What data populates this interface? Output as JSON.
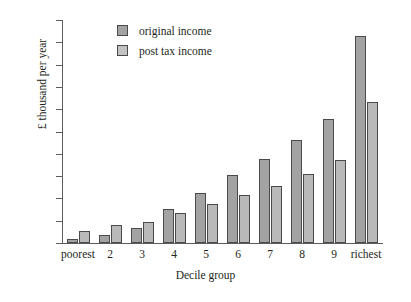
{
  "chart_data": {
    "type": "bar",
    "title": "",
    "xlabel": "Decile group",
    "ylabel": "£ thousand per year",
    "categories": [
      "poorest",
      "2",
      "3",
      "4",
      "5",
      "6",
      "7",
      "8",
      "9",
      "richest"
    ],
    "series": [
      {
        "name": "original income",
        "color": "#a3a3a3",
        "values": [
          0.8,
          1.7,
          3.4,
          7.6,
          11.2,
          15.3,
          18.8,
          23.0,
          27.8,
          46.4
        ]
      },
      {
        "name": "post tax income",
        "color": "#c2c2c2",
        "values": [
          2.8,
          4.0,
          4.8,
          6.8,
          8.7,
          10.8,
          12.8,
          15.5,
          18.6,
          31.6
        ]
      }
    ],
    "ylim": [
      0,
      50
    ],
    "ystep": 5,
    "yticks": [
      "0",
      "5",
      "10",
      "15",
      "20",
      "25",
      "30",
      "35",
      "40",
      "45",
      "50"
    ],
    "grid": false,
    "legend_position": "top-left-inside"
  },
  "legend": {
    "items": [
      {
        "label": "original income",
        "swatch": "orig"
      },
      {
        "label": "post tax income",
        "swatch": "post"
      }
    ]
  }
}
